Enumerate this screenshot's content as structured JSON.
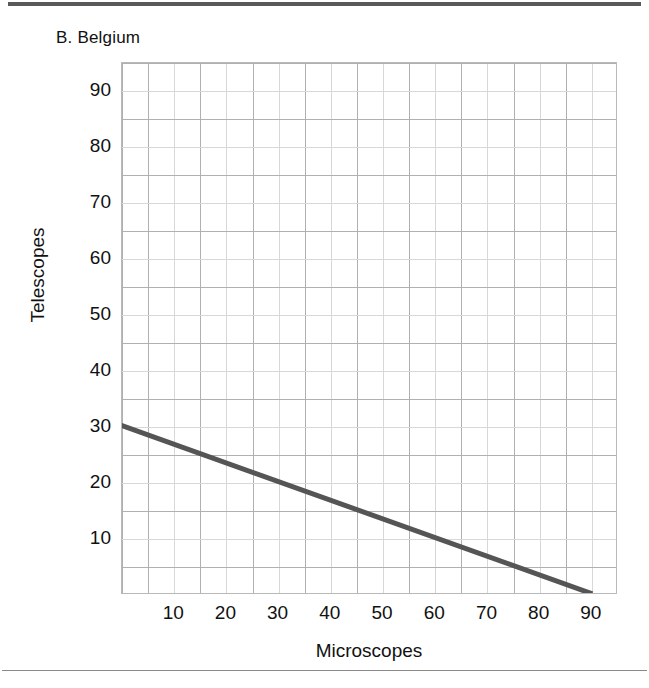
{
  "figure": {
    "panel_label": "B. Belgium",
    "rule_color": "#595959"
  },
  "chart_data": {
    "type": "line",
    "title": "B. Belgium",
    "xlabel": "Microscopes",
    "ylabel": "Telescopes",
    "xlim": [
      0,
      95
    ],
    "ylim": [
      0,
      95
    ],
    "grid": true,
    "grid_major_step": 5,
    "legend": null,
    "xticks": [
      10,
      20,
      30,
      40,
      50,
      60,
      70,
      80,
      90
    ],
    "yticks": [
      10,
      20,
      30,
      40,
      50,
      60,
      70,
      80,
      90
    ],
    "series": [
      {
        "name": "Production possibility frontier",
        "color": "#555555",
        "line_width": 5,
        "x": [
          0,
          90
        ],
        "y": [
          30,
          0
        ],
        "points": [
          {
            "x": 0,
            "y": 30
          },
          {
            "x": 90,
            "y": 0
          }
        ],
        "slope": -0.3333,
        "intercept": 30
      }
    ]
  }
}
